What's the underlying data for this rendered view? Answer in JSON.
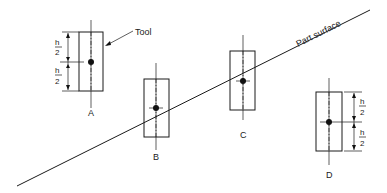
{
  "diagram": {
    "surface_label": "Part surface",
    "tool_label": "Tool",
    "dimension_label_numerator": "h",
    "dimension_label_denominator": "2",
    "positions": [
      {
        "id": "A",
        "label": "A"
      },
      {
        "id": "B",
        "label": "B"
      },
      {
        "id": "C",
        "label": "C"
      },
      {
        "id": "D",
        "label": "D"
      }
    ]
  },
  "colors": {
    "line": "#1a1a1a",
    "background": "#ffffff"
  }
}
